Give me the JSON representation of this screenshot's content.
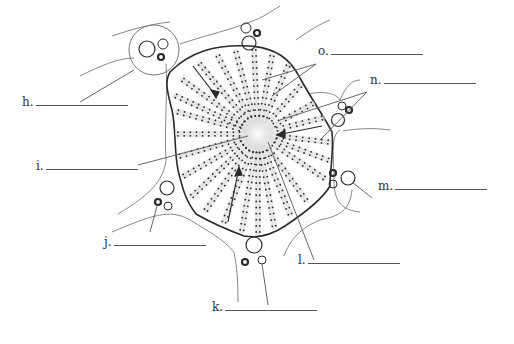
{
  "labels": [
    {
      "letter": "h.",
      "x": 22,
      "y": 108,
      "blank_width": 92
    },
    {
      "letter": "i.",
      "x": 36,
      "y": 172,
      "blank_width": 92
    },
    {
      "letter": "j.",
      "x": 104,
      "y": 248,
      "blank_width": 92
    },
    {
      "letter": "k.",
      "x": 212,
      "y": 313,
      "blank_width": 92
    },
    {
      "letter": "l.",
      "x": 298,
      "y": 266,
      "blank_width": 92
    },
    {
      "letter": "m.",
      "x": 378,
      "y": 192,
      "blank_width": 92
    },
    {
      "letter": "n.",
      "x": 370,
      "y": 86,
      "blank_width": 92
    },
    {
      "letter": "o.",
      "x": 318,
      "y": 57,
      "blank_width": 92
    }
  ],
  "colors": {
    "outline": "#2a2a2a",
    "septum": "#777777",
    "dots": "#2a2a2a",
    "sinusoid_shade": "#d8d8d8",
    "leader": "#666666"
  }
}
